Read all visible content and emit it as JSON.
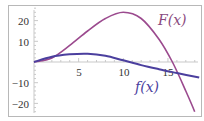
{
  "chart_data": {
    "type": "line",
    "title": "",
    "xlabel": "",
    "ylabel": "",
    "xlim": [
      0,
      18.5
    ],
    "ylim": [
      -25,
      27
    ],
    "grid": false,
    "x_ticks": [
      5,
      10,
      15
    ],
    "x_tick_labels": [
      "5",
      "10",
      "15"
    ],
    "y_ticks": [
      20,
      10,
      -10,
      -20
    ],
    "y_tick_labels": [
      "20",
      "10",
      "−10",
      "−20"
    ],
    "series": [
      {
        "name": "F(x)",
        "color": "#9b4a8e",
        "x": [
          0,
          2,
          4,
          6,
          8,
          10,
          12,
          14,
          15.5,
          17,
          18
        ],
        "values": [
          0,
          2,
          8,
          15,
          21,
          24,
          21,
          11,
          0,
          -14,
          -24
        ]
      },
      {
        "name": "f(x)",
        "color": "#4b3f9e",
        "x": [
          0,
          2,
          4,
          6,
          8,
          10,
          12,
          14,
          16,
          18.5
        ],
        "values": [
          0,
          2.5,
          3.7,
          4,
          3,
          0.8,
          -1.5,
          -3.5,
          -5.3,
          -7.5
        ]
      }
    ],
    "annotations": [
      {
        "text": "F(x)",
        "x": 16.5,
        "y": 20
      },
      {
        "text": "f(x)",
        "x": 12.5,
        "y": -13
      }
    ]
  },
  "labels": {
    "F": "F(x)",
    "f": "f(x)",
    "xt5": "5",
    "xt10": "10",
    "xt15": "15",
    "yt20": "20",
    "yt10": "10",
    "ytm10": "−10",
    "ytm20": "−20"
  }
}
